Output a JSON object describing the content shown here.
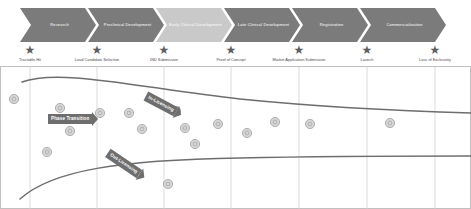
{
  "colors": {
    "arrow_dark": "#7b7b7b",
    "arrow_light": "#c9c9c9",
    "star": "#5f5f5f",
    "curve": "#6e6e6e",
    "gridline": "#d2d2d2",
    "dot_fill": "#d6d6d6",
    "dot_stroke": "#a8a8a8",
    "banner": "#6e6e6e",
    "text_dark": "#4a4a4a",
    "text_on_arrow": "#ffffff",
    "plot_border": "#c0c0c0"
  },
  "phases": [
    {
      "label": "Research",
      "x": 20,
      "width": 76,
      "tone": "dark"
    },
    {
      "label": "Preclinical Development",
      "x": 88,
      "width": 76,
      "tone": "dark"
    },
    {
      "label": "Early Clinical Development",
      "x": 156,
      "width": 76,
      "tone": "light"
    },
    {
      "label": "Late Clinical Development",
      "x": 224,
      "width": 76,
      "tone": "dark"
    },
    {
      "label": "Registration",
      "x": 292,
      "width": 76,
      "tone": "dark"
    },
    {
      "label": "Commercialization",
      "x": 360,
      "width": 86,
      "tone": "dark"
    }
  ],
  "milestones": [
    {
      "label": "Tractable Hit",
      "x": 30
    },
    {
      "label": "Lead Candidate Selection",
      "x": 97
    },
    {
      "label": "IND Submission",
      "x": 164
    },
    {
      "label": "Proof of Concept",
      "x": 231
    },
    {
      "label": "Market Application Submission",
      "x": 299
    },
    {
      "label": "Launch",
      "x": 367
    },
    {
      "label": "Loss of Exclusivity",
      "x": 435
    }
  ],
  "gridlines": [
    30,
    97,
    164,
    231,
    299,
    367,
    435
  ],
  "callouts": [
    {
      "label": "In-Licensing",
      "x": 146,
      "y": 25,
      "rotate": 28
    },
    {
      "label": "Phase Transition",
      "x": 48,
      "y": 48,
      "rotate": 0
    },
    {
      "label": "Out-Licensing",
      "x": 108,
      "y": 82,
      "rotate": 34
    }
  ],
  "chart_data": {
    "type": "scatter",
    "title": "",
    "xlabel": "",
    "ylabel": "",
    "grid": true,
    "legend_position": "none",
    "x_tick_labels": [
      "Tractable Hit",
      "Lead Candidate Selection",
      "IND Submission",
      "Proof of Concept",
      "Market Application Submission",
      "Launch",
      "Loss of Exclusivity"
    ],
    "x_tick_positions": [
      30,
      97,
      164,
      231,
      299,
      367,
      435
    ],
    "curves": [
      {
        "name": "upper-boundary-curve",
        "path": "M 22,16 C 60,2 140,22 240,33 C 320,41 400,45 471,47",
        "stroke": "#6e6e6e",
        "stroke_width": 1.5
      },
      {
        "name": "lower-boundary-curve",
        "path": "M 20,133 C 52,104 120,94 240,92 C 330,90 410,90 471,90",
        "stroke": "#6e6e6e",
        "stroke_width": 1.5
      }
    ],
    "points": [
      {
        "x": 14,
        "y": 33,
        "r": 4.6
      },
      {
        "x": 60,
        "y": 42,
        "r": 4.6
      },
      {
        "x": 100,
        "y": 47,
        "r": 4.6
      },
      {
        "x": 70,
        "y": 65,
        "r": 4.6
      },
      {
        "x": 129,
        "y": 47,
        "r": 4.6
      },
      {
        "x": 142,
        "y": 63,
        "r": 4.6
      },
      {
        "x": 176,
        "y": 45,
        "r": 4.6
      },
      {
        "x": 185,
        "y": 62,
        "r": 4.6
      },
      {
        "x": 218,
        "y": 58,
        "r": 4.6
      },
      {
        "x": 247,
        "y": 67,
        "r": 4.6
      },
      {
        "x": 275,
        "y": 56,
        "r": 4.6
      },
      {
        "x": 310,
        "y": 58,
        "r": 4.6
      },
      {
        "x": 390,
        "y": 57,
        "r": 4.6
      },
      {
        "x": 47,
        "y": 86,
        "r": 4.6
      },
      {
        "x": 195,
        "y": 78,
        "r": 4.6
      },
      {
        "x": 168,
        "y": 118,
        "r": 4.6
      }
    ]
  }
}
